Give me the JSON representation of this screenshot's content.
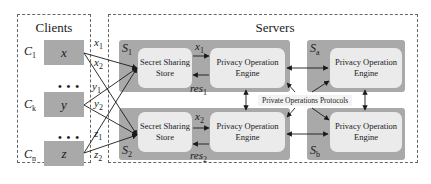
{
  "clients": {
    "title": "Clients",
    "items": [
      {
        "id": "C",
        "sub": "1",
        "value": "x"
      },
      {
        "id": "C",
        "sub": "k",
        "value": "y"
      },
      {
        "id": "C",
        "sub": "n",
        "value": "z"
      }
    ],
    "ellipsis": "• • •"
  },
  "shares": {
    "x1": {
      "base": "x",
      "sub": "1"
    },
    "x2": {
      "base": "x",
      "sub": "2"
    },
    "y1": {
      "base": "y",
      "sub": "1"
    },
    "y2": {
      "base": "y",
      "sub": "2"
    },
    "z1": {
      "base": "z",
      "sub": "1"
    },
    "z2": {
      "base": "z",
      "sub": "2"
    }
  },
  "servers": {
    "title": "Servers",
    "s1": {
      "base": "S",
      "sub": "1",
      "store_line1": "Secret Sharing",
      "store_line2": "Store",
      "engine_line1": "Privacy Operation",
      "engine_line2": "Engine",
      "in": {
        "base": "x",
        "sub": "1"
      },
      "out": {
        "base": "res",
        "sub": "1"
      }
    },
    "s2": {
      "base": "S",
      "sub": "2",
      "store_line1": "Secret Sharing",
      "store_line2": "Store",
      "engine_line1": "Privacy Operation",
      "engine_line2": "Engine",
      "in": {
        "base": "x",
        "sub": "2"
      },
      "out": {
        "base": "res",
        "sub": "2"
      }
    },
    "sa": {
      "base": "S",
      "sub": "a",
      "engine_line1": "Privacy Operation",
      "engine_line2": "Engine"
    },
    "sb": {
      "base": "S",
      "sub": "b",
      "engine_line1": "Privacy Operation",
      "engine_line2": "Engine"
    },
    "protocols_label": "Private Operations Protocols"
  },
  "colors": {
    "server_box": "#a9a9a9",
    "inner_box": "#ebebeb",
    "border": "#666666",
    "arrow": "#1a1a1a"
  }
}
